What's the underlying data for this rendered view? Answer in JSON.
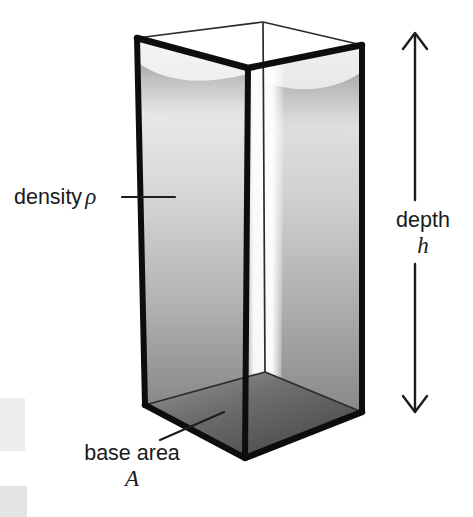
{
  "figure": {
    "background_color": "#ffffff",
    "ink_color": "#151515",
    "canvas": {
      "width": 473,
      "height": 517
    }
  },
  "labels": {
    "density": {
      "text": "density",
      "symbol": "ρ",
      "leader": "horizontal line from text to left wall of column"
    },
    "depth": {
      "text": "depth",
      "symbol": "h",
      "leader": "vertical double-headed arrow spanning full height of column"
    },
    "base_area": {
      "text": "base area",
      "symbol": "A",
      "leader": "diagonal line from text up-right to the base face"
    }
  },
  "geometry": {
    "top_rim": {
      "left": [
        137,
        38
      ],
      "back": [
        263,
        22
      ],
      "right": [
        362,
        45
      ],
      "front": [
        248,
        68
      ]
    },
    "base": {
      "left": [
        145,
        405
      ],
      "back": [
        265,
        372
      ],
      "right": [
        362,
        412
      ],
      "front": [
        245,
        458
      ]
    },
    "edge_stroke_px": 6,
    "hidden_edge_stroke_px": 1.6
  },
  "arrow": {
    "name": "depth-dimension-arrow",
    "x": 415,
    "y_top": 32,
    "y_bottom": 413,
    "head_style": "open chevron, both ends",
    "gap_for_label": [
      200,
      264
    ]
  },
  "shading": {
    "wall_left_top": "#f2f2f2",
    "wall_left_bottom": "#6f6f6f",
    "wall_right_top": "#ededed",
    "wall_right_bottom": "#7a7a7a",
    "front_highlight": "#fbfbfb",
    "floor_near": "#4d4d4d",
    "floor_far": "#8c8c8c",
    "surface_haze": "#b9b9b9"
  },
  "artifacts": {
    "upper_block": {
      "color": "#eceded",
      "x": 0,
      "y": 398,
      "width": 25,
      "height": 53
    },
    "lower_block": {
      "color": "#e3e4e4",
      "x": 0,
      "y": 486,
      "width": 27,
      "height": 31
    }
  }
}
